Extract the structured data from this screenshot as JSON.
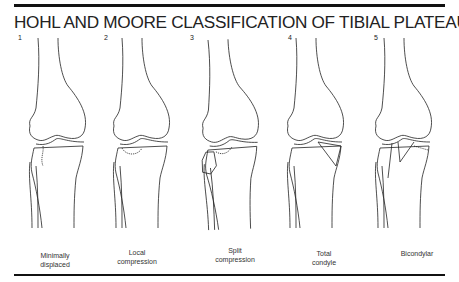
{
  "figure": {
    "title": "HOHL AND MOORE CLASSIFICATION OF TIBIAL PLATEAU FRACTURES",
    "types": [
      {
        "number": "1",
        "caption_line1": "Minimally",
        "caption_line2": "displaced"
      },
      {
        "number": "2",
        "caption_line1": "Local",
        "caption_line2": "compression"
      },
      {
        "number": "3",
        "caption_line1": "Split",
        "caption_line2": "compression"
      },
      {
        "number": "4",
        "caption_line1": "Total",
        "caption_line2": "condyle"
      },
      {
        "number": "5",
        "caption_line1": "Bicondylar",
        "caption_line2": ""
      }
    ]
  }
}
